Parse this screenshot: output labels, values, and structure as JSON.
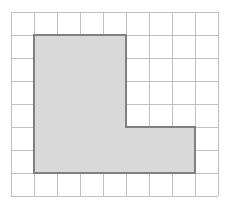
{
  "chart_data": {
    "type": "grid-shape",
    "xlabel": "",
    "ylabel": "",
    "grid": {
      "visible": true,
      "columns": 9,
      "rows": 8,
      "cell_size": 23,
      "origin_x": 11,
      "origin_y": 12,
      "line_color": "#bfbfbf",
      "line_width": 1
    },
    "shape": {
      "name": "L-shape",
      "fill_color": "#d9d9d9",
      "stroke_color": "#808080",
      "stroke_width": 2,
      "unit_area": 24,
      "unit_perimeter": 22,
      "vertices_grid": [
        [
          1,
          1
        ],
        [
          5,
          1
        ],
        [
          5,
          5
        ],
        [
          8,
          5
        ],
        [
          8,
          7
        ],
        [
          1,
          7
        ]
      ],
      "vertices_px": [
        [
          34,
          35
        ],
        [
          126,
          35
        ],
        [
          126,
          127
        ],
        [
          195,
          127
        ],
        [
          195,
          173
        ],
        [
          34,
          173
        ]
      ],
      "path_d": "M 34 35 L 126 35 L 126 127 L 195 127 L 195 173 L 34 173 Z",
      "segments": [
        {
          "name": "top-edge",
          "from_grid": [
            1,
            1
          ],
          "to_grid": [
            5,
            1
          ],
          "units": 4,
          "orientation": "horizontal"
        },
        {
          "name": "upper-right-edge",
          "from_grid": [
            5,
            1
          ],
          "to_grid": [
            5,
            5
          ],
          "units": 4,
          "orientation": "vertical"
        },
        {
          "name": "notch-edge",
          "from_grid": [
            5,
            5
          ],
          "to_grid": [
            8,
            5
          ],
          "units": 3,
          "orientation": "horizontal"
        },
        {
          "name": "lower-right-edge",
          "from_grid": [
            8,
            5
          ],
          "to_grid": [
            8,
            7
          ],
          "units": 2,
          "orientation": "vertical"
        },
        {
          "name": "bottom-edge",
          "from_grid": [
            8,
            7
          ],
          "to_grid": [
            1,
            7
          ],
          "units": 7,
          "orientation": "horizontal"
        },
        {
          "name": "left-edge",
          "from_grid": [
            1,
            7
          ],
          "to_grid": [
            1,
            1
          ],
          "units": 6,
          "orientation": "vertical"
        }
      ],
      "parts": [
        {
          "name": "vertical-arm",
          "width_units": 4,
          "height_units": 6,
          "area_units": 24
        },
        {
          "name": "horizontal-arm",
          "width_units": 3,
          "height_units": 2,
          "area_units": 6
        }
      ]
    }
  }
}
